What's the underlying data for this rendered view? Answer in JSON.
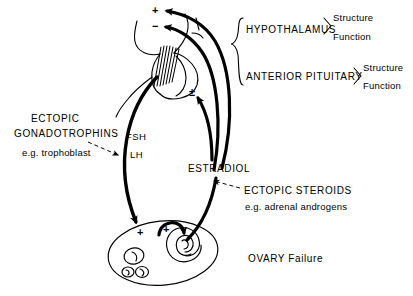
{
  "diagram": {
    "background_color": "#ffffff",
    "line_color": "#000000",
    "width": 413,
    "height": 296
  },
  "central_axis": {
    "brace_label": "brace-hypothalamus-pituitary",
    "hypothalamus": {
      "label": "HYPOTHALAMUS",
      "attributes": [
        "Structure",
        "Function"
      ]
    },
    "anterior_pituitary": {
      "label": "ANTERIOR PITUITARY",
      "attributes": [
        "Structure",
        "Function"
      ]
    }
  },
  "ectopic_gonadotrophins": {
    "line1": "ECTOPIC",
    "line2": "GONADOTROPHINS",
    "example": "e.g. trophoblast"
  },
  "ectopic_steroids": {
    "line1": "ECTOPIC  STEROIDS",
    "example": "e.g. adrenal androgens"
  },
  "hormones": {
    "fsh": "FSH",
    "lh": "LH",
    "estradiol": "ESTRADIOL"
  },
  "ovary": {
    "label": "OVARY Failure"
  },
  "feedback_signs": {
    "hypothalamus_positive": "+",
    "hypothalamus_negative": "−",
    "pituitary_both": "±",
    "ovary_left_positive": "+",
    "ovary_right_positive": "+"
  },
  "attribute_words": {
    "structure": "Structure",
    "function": "Function"
  }
}
